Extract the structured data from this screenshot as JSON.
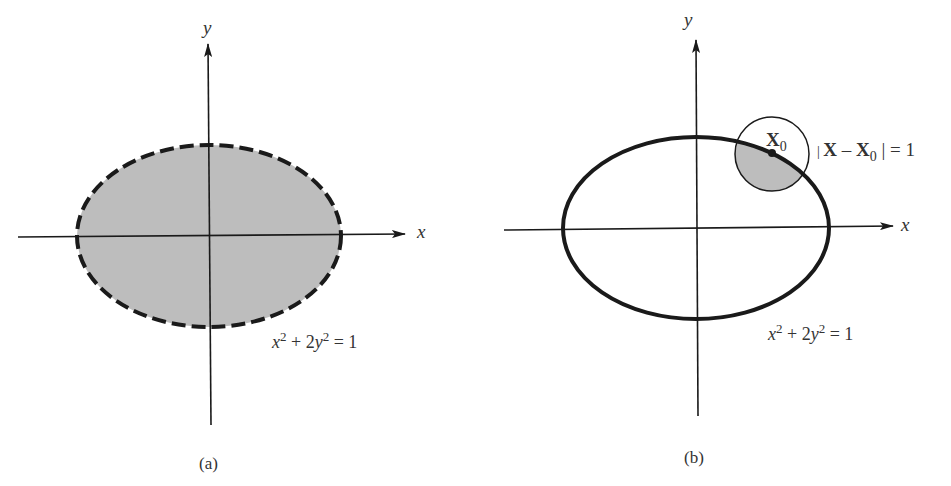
{
  "figure": {
    "panels": [
      {
        "id": "a",
        "caption": "(a)",
        "x_axis_label": "x",
        "y_axis_label": "y",
        "equation": {
          "base1": "x",
          "exp1": "2",
          "mid": " + 2",
          "base2": "y",
          "exp2": "2",
          "rhs": " = 1"
        },
        "ellipse_style": "dashed boundary, shaded interior",
        "fill_color": "#bdbdbd",
        "stroke_color": "#1a1a1a"
      },
      {
        "id": "b",
        "caption": "(b)",
        "x_axis_label": "x",
        "y_axis_label": "y",
        "equation": {
          "base1": "x",
          "exp1": "2",
          "mid": " + 2",
          "base2": "y",
          "exp2": "2",
          "rhs": " = 1"
        },
        "ellipse_style": "solid boundary, unshaded interior",
        "point_label": {
          "base": "X",
          "sub": "0"
        },
        "circle_label": {
          "open": "| ",
          "base1": "X",
          "minus": " – ",
          "base2": "X",
          "sub": "0",
          "close": " | = 1"
        },
        "fill_color": "#bdbdbd",
        "stroke_color": "#1a1a1a"
      }
    ]
  }
}
